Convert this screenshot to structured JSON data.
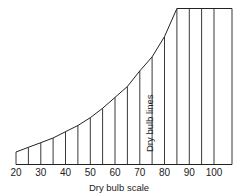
{
  "diagram": {
    "title": "Dry bulb scale",
    "vertical_label": "Dry bulb lines",
    "tick_labels": [
      "20",
      "30",
      "40",
      "50",
      "60",
      "70",
      "80",
      "90",
      "100"
    ],
    "line_color": "#222222"
  },
  "chart_data": {
    "type": "line",
    "title": "",
    "xlabel": "Dry bulb scale",
    "ylabel": "",
    "x_ticks": [
      20,
      30,
      40,
      50,
      60,
      70,
      80,
      90,
      100
    ],
    "xlim": [
      20,
      106
    ],
    "grid": false,
    "annotations": [
      "Dry bulb lines"
    ],
    "series": [
      {
        "name": "Saturation curve (top boundary)",
        "x": [
          20,
          25,
          30,
          35,
          40,
          45,
          50,
          55,
          60,
          65,
          70,
          75,
          80,
          85,
          90,
          95,
          100,
          105
        ],
        "relative_height": [
          0.08,
          0.11,
          0.14,
          0.17,
          0.21,
          0.25,
          0.3,
          0.36,
          0.43,
          0.5,
          0.6,
          0.69,
          0.82,
          1.0,
          1.0,
          1.0,
          1.0,
          1.0
        ]
      }
    ],
    "vertical_lines_at": [
      20,
      25,
      30,
      35,
      40,
      45,
      50,
      55,
      60,
      65,
      70,
      75,
      80,
      85,
      90,
      95,
      100,
      105
    ]
  }
}
